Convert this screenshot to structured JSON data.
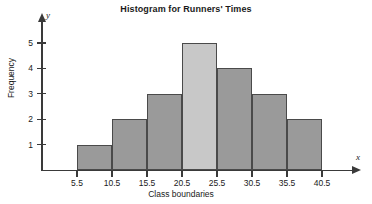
{
  "chart_data": {
    "type": "bar",
    "title": "Histogram for Runners' Times",
    "xlabel": "Class boundaries",
    "ylabel": "Frequency",
    "x_axis_letter": "y",
    "y_axis_letter": "x",
    "boundaries": [
      5.5,
      10.5,
      15.5,
      20.5,
      25.5,
      30.5,
      35.5,
      40.5
    ],
    "boundary_labels": [
      "5.5",
      "10.5",
      "15.5",
      "20.5",
      "25.5",
      "30.5",
      "35.5",
      "40.5"
    ],
    "categories": [
      "5.5-10.5",
      "10.5-15.5",
      "15.5-20.5",
      "20.5-25.5",
      "25.5-30.5",
      "30.5-35.5",
      "35.5-40.5"
    ],
    "values": [
      1,
      2,
      3,
      5,
      4,
      3,
      2
    ],
    "y_ticks": [
      1,
      2,
      3,
      4,
      5
    ],
    "y_tick_labels": [
      "1",
      "2",
      "3",
      "4",
      "5"
    ],
    "ylim": [
      0,
      5
    ],
    "xlim": [
      5.5,
      40.5
    ],
    "grid": false,
    "legend": "none",
    "bar_color": "#9a9a9a",
    "bar_highlight_color": "#c8c8c8",
    "bar_border_color": "#4a4a4a",
    "highlight_index": 3,
    "axis_color": "#3a3a3a",
    "background_color": "#ffffff"
  },
  "axis_letters": {
    "y": "y",
    "x": "x"
  }
}
